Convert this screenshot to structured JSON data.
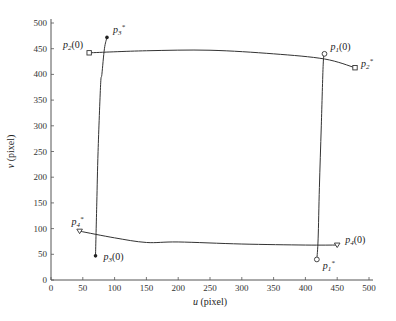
{
  "chart_data": {
    "type": "line",
    "title": "",
    "xlabel": "u (pixel)",
    "ylabel": "v (pixel)",
    "xlim": [
      0,
      500
    ],
    "ylim": [
      0,
      500
    ],
    "xticks": [
      0,
      50,
      100,
      150,
      200,
      250,
      300,
      350,
      400,
      450,
      500
    ],
    "yticks": [
      0,
      50,
      100,
      150,
      200,
      250,
      300,
      350,
      400,
      450,
      500
    ],
    "grid": false,
    "points": [
      {
        "name": "p1(0)",
        "label_main": "p",
        "sub": "1",
        "suffix": "(0)",
        "u": 430,
        "v": 440,
        "marker": "circle"
      },
      {
        "name": "p2(0)",
        "label_main": "p",
        "sub": "2",
        "suffix": "(0)",
        "u": 60,
        "v": 442,
        "marker": "square"
      },
      {
        "name": "p3(0)",
        "label_main": "p",
        "sub": "3",
        "suffix": "(0)",
        "u": 70,
        "v": 47,
        "marker": "dot"
      },
      {
        "name": "p4(0)",
        "label_main": "p",
        "sub": "4",
        "suffix": "(0)",
        "u": 450,
        "v": 68,
        "marker": "triangle"
      },
      {
        "name": "p1*",
        "label_main": "p",
        "sub": "1",
        "suffix": "*",
        "u": 418,
        "v": 40,
        "marker": "circle"
      },
      {
        "name": "p2*",
        "label_main": "p",
        "sub": "2",
        "suffix": "*",
        "u": 478,
        "v": 413,
        "marker": "square"
      },
      {
        "name": "p3*",
        "label_main": "p",
        "sub": "3",
        "suffix": "*",
        "u": 88,
        "v": 472,
        "marker": "dot"
      },
      {
        "name": "p4*",
        "label_main": "p",
        "sub": "4",
        "suffix": "*",
        "u": 45,
        "v": 95,
        "marker": "triangle"
      }
    ],
    "series": [
      {
        "name": "p1 trajectory",
        "u": [
          430,
          428,
          425,
          422,
          420,
          418
        ],
        "v": [
          440,
          420,
          300,
          180,
          80,
          40
        ]
      },
      {
        "name": "p2 trajectory",
        "u": [
          60,
          150,
          250,
          350,
          430,
          478
        ],
        "v": [
          442,
          446,
          447,
          440,
          430,
          413
        ]
      },
      {
        "name": "p3 trajectory",
        "u": [
          70,
          72,
          74,
          78,
          80,
          84,
          88
        ],
        "v": [
          47,
          150,
          250,
          380,
          400,
          450,
          472
        ]
      },
      {
        "name": "p4 trajectory",
        "u": [
          450,
          400,
          300,
          200,
          150,
          100,
          45
        ],
        "v": [
          68,
          68,
          70,
          74,
          73,
          82,
          95
        ]
      }
    ]
  }
}
